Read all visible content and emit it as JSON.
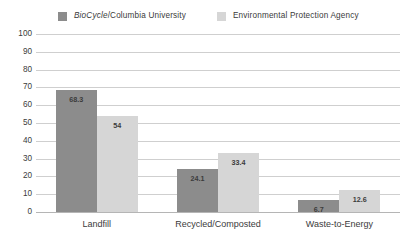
{
  "chart_data": {
    "type": "bar",
    "title": "",
    "subtitle": "",
    "xlabel": "",
    "ylabel": "",
    "ylim": [
      0,
      100
    ],
    "ytick_step": 10,
    "yticks": [
      "100",
      "90",
      "80",
      "70",
      "60",
      "50",
      "40",
      "30",
      "20",
      "10",
      "0"
    ],
    "grid": true,
    "legend_position": "top",
    "categories": [
      "Landfill",
      "Recycled/Composted",
      "Waste-to-Energy"
    ],
    "series": [
      {
        "name": "BioCycle/Columbia University",
        "name_italic_part": "BioCycle",
        "name_rest": "/Columbia University",
        "color": "#8C8C8C",
        "values": [
          68.3,
          24.1,
          6.7
        ],
        "labels": [
          "68.3",
          "24.1",
          "6.7"
        ]
      },
      {
        "name": "Environmental Protection Agency",
        "color": "#D6D6D6",
        "values": [
          54,
          33.4,
          12.6
        ],
        "labels": [
          "54",
          "33.4",
          "12.6"
        ]
      }
    ]
  },
  "legend": {
    "items": [
      {
        "label_italic": "BioCycle",
        "label_rest": "/Columbia University"
      },
      {
        "label_italic": "",
        "label_rest": "Environmental Protection Agency"
      }
    ]
  },
  "colors": {
    "series1": "#8C8C8C",
    "series2": "#D6D6D6",
    "gridline": "#CFCFCF",
    "axis": "#B5B5B5",
    "text": "#3B3B3B",
    "background": "#FFFFFF"
  }
}
